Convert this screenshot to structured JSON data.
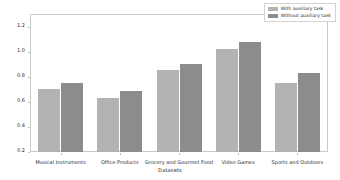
{
  "chart_data": {
    "type": "bar",
    "title": "",
    "xlabel": "Datasets",
    "ylabel": "MSE",
    "ylim": [
      0.2,
      1.3
    ],
    "yticks": [
      "0.2",
      "0.4",
      "0.6",
      "0.8",
      "1.0",
      "1.2"
    ],
    "ytick_values": [
      0.2,
      0.4,
      0.6,
      0.8,
      1.0,
      1.2
    ],
    "grid": false,
    "legend_position": "upper right",
    "categories": [
      "Musical Instruments",
      "Office Products",
      "Grocery and Gourmet Food",
      "Video Games",
      "Sports and Outdoors"
    ],
    "series": [
      {
        "name": "With auxiliary task",
        "color": "#b3b3b3",
        "values": [
          0.7,
          0.63,
          0.85,
          1.02,
          0.75
        ]
      },
      {
        "name": "Without auxiliary task",
        "color": "#8c8c8c",
        "values": [
          0.75,
          0.69,
          0.9,
          1.08,
          0.83
        ]
      }
    ]
  },
  "legend": {
    "items": [
      {
        "label": "With auxiliary task"
      },
      {
        "label": "Without auxiliary task"
      }
    ]
  }
}
